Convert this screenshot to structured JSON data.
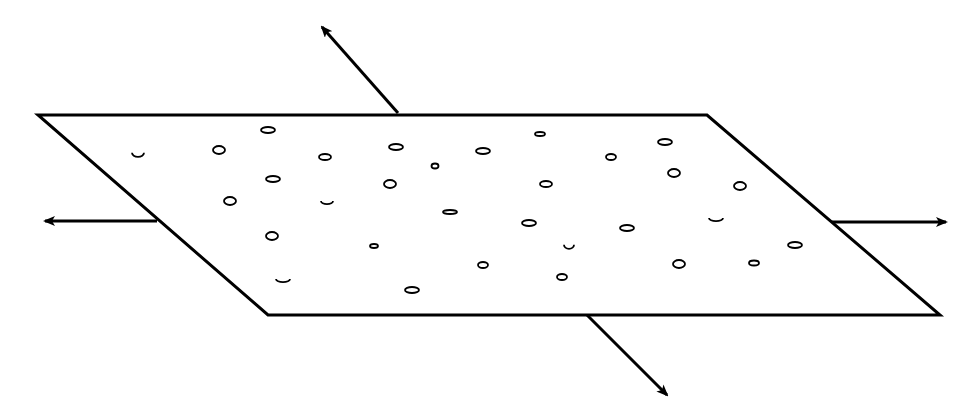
{
  "diagram": {
    "colors": {
      "stroke": "#000000",
      "background": "#ffffff"
    },
    "plane": {
      "corners": [
        [
          38,
          115
        ],
        [
          707,
          115
        ],
        [
          940,
          315
        ],
        [
          268,
          315
        ]
      ]
    },
    "arrows": [
      {
        "name": "arrow-up-left",
        "from": [
          398,
          113
        ],
        "to": [
          322,
          27
        ]
      },
      {
        "name": "arrow-left",
        "from": [
          157,
          221
        ],
        "to": [
          45,
          221
        ]
      },
      {
        "name": "arrow-right",
        "from": [
          832,
          222
        ],
        "to": [
          946,
          222
        ]
      },
      {
        "name": "arrow-down-right",
        "from": [
          587,
          315
        ],
        "to": [
          667,
          395
        ]
      }
    ],
    "particles": [
      {
        "type": "arc",
        "cx": 138,
        "cy": 154,
        "rx": 6,
        "ry": 4
      },
      {
        "type": "ellipse",
        "cx": 268,
        "cy": 130,
        "rx": 7,
        "ry": 3
      },
      {
        "type": "ellipse",
        "cx": 219,
        "cy": 150,
        "rx": 6,
        "ry": 4
      },
      {
        "type": "ellipse",
        "cx": 325,
        "cy": 157,
        "rx": 6,
        "ry": 3
      },
      {
        "type": "ellipse",
        "cx": 396,
        "cy": 147,
        "rx": 7,
        "ry": 3
      },
      {
        "type": "ellipse",
        "cx": 435,
        "cy": 166,
        "rx": 3.5,
        "ry": 2.5
      },
      {
        "type": "ellipse",
        "cx": 483,
        "cy": 151,
        "rx": 7,
        "ry": 3
      },
      {
        "type": "ellipse",
        "cx": 540,
        "cy": 134,
        "rx": 5,
        "ry": 2
      },
      {
        "type": "ellipse",
        "cx": 611,
        "cy": 157,
        "rx": 5,
        "ry": 3
      },
      {
        "type": "ellipse",
        "cx": 665,
        "cy": 142,
        "rx": 7,
        "ry": 3
      },
      {
        "type": "ellipse",
        "cx": 273,
        "cy": 179,
        "rx": 7,
        "ry": 3
      },
      {
        "type": "ellipse",
        "cx": 390,
        "cy": 184,
        "rx": 6,
        "ry": 4
      },
      {
        "type": "ellipse",
        "cx": 546,
        "cy": 184,
        "rx": 6,
        "ry": 3
      },
      {
        "type": "ellipse",
        "cx": 674,
        "cy": 173,
        "rx": 6,
        "ry": 4
      },
      {
        "type": "ellipse",
        "cx": 740,
        "cy": 186,
        "rx": 6,
        "ry": 4
      },
      {
        "type": "ellipse",
        "cx": 230,
        "cy": 201,
        "rx": 6,
        "ry": 4
      },
      {
        "type": "arc",
        "cx": 327,
        "cy": 202,
        "rx": 6,
        "ry": 3
      },
      {
        "type": "ellipse",
        "cx": 450,
        "cy": 212,
        "rx": 7,
        "ry": 2
      },
      {
        "type": "ellipse",
        "cx": 529,
        "cy": 223,
        "rx": 7,
        "ry": 3
      },
      {
        "type": "ellipse",
        "cx": 627,
        "cy": 228,
        "rx": 7,
        "ry": 3
      },
      {
        "type": "arc",
        "cx": 716,
        "cy": 219,
        "rx": 7,
        "ry": 3
      },
      {
        "type": "ellipse",
        "cx": 272,
        "cy": 236,
        "rx": 6,
        "ry": 4
      },
      {
        "type": "ellipse",
        "cx": 374,
        "cy": 246,
        "rx": 4,
        "ry": 2
      },
      {
        "type": "arc",
        "cx": 569,
        "cy": 246,
        "rx": 5,
        "ry": 4
      },
      {
        "type": "ellipse",
        "cx": 795,
        "cy": 245,
        "rx": 7,
        "ry": 3
      },
      {
        "type": "ellipse",
        "cx": 483,
        "cy": 265,
        "rx": 5,
        "ry": 3
      },
      {
        "type": "ellipse",
        "cx": 679,
        "cy": 264,
        "rx": 6,
        "ry": 4
      },
      {
        "type": "ellipse",
        "cx": 754,
        "cy": 263,
        "rx": 5,
        "ry": 2.5
      },
      {
        "type": "arc",
        "cx": 283,
        "cy": 280,
        "rx": 7,
        "ry": 3
      },
      {
        "type": "ellipse",
        "cx": 562,
        "cy": 277,
        "rx": 5,
        "ry": 3
      },
      {
        "type": "ellipse",
        "cx": 412,
        "cy": 290,
        "rx": 7,
        "ry": 3
      }
    ]
  }
}
